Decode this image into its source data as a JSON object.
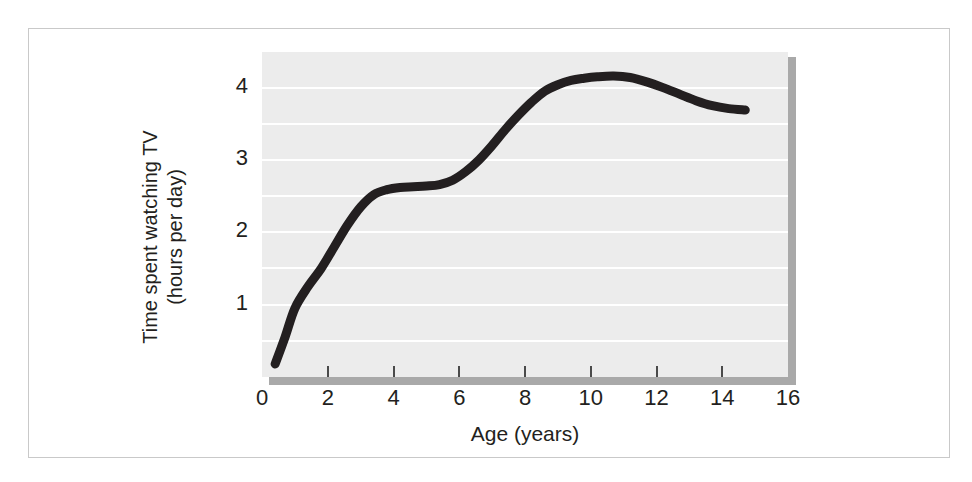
{
  "figure": {
    "background_color": "#ffffff",
    "frame_color": "#c9c9c9",
    "panel_color": "#ececec",
    "gridline_color": "#ffffff",
    "shadow_color": "#a9a9a9",
    "curve_color": "#231f20"
  },
  "chart_data": {
    "type": "line",
    "title": "",
    "subtitle": "",
    "xlabel": "Age (years)",
    "ylabel_line1": "Time spent watching TV",
    "ylabel_line2": "(hours per day)",
    "xlim": [
      0,
      16
    ],
    "ylim": [
      0,
      4.52
    ],
    "xticks": [
      0,
      2,
      4,
      6,
      8,
      10,
      12,
      14,
      16
    ],
    "xtick_labels": [
      "0",
      "2",
      "4",
      "6",
      "8",
      "10",
      "12",
      "14",
      "16"
    ],
    "yticks": [
      1,
      2,
      3,
      4
    ],
    "ytick_labels": [
      "1",
      "2",
      "3",
      "4"
    ],
    "grid": "horizontal",
    "gridline_interval": 0.5,
    "gridline_values": [
      0.5,
      1.0,
      1.5,
      2.0,
      2.5,
      3.0,
      3.5,
      4.0,
      4.5
    ],
    "legend": "none",
    "annotations": [],
    "series": [
      {
        "name": "Time spent watching TV",
        "color": "#231f20",
        "line_width": 9,
        "x": [
          0.4,
          0.7,
          1.0,
          1.4,
          1.8,
          2.2,
          2.6,
          3.0,
          3.4,
          3.8,
          4.2,
          4.6,
          5.0,
          5.4,
          5.8,
          6.2,
          6.6,
          7.0,
          7.4,
          7.8,
          8.2,
          8.6,
          9.0,
          9.4,
          9.8,
          10.2,
          10.7,
          11.2,
          11.7,
          12.2,
          12.7,
          13.2,
          13.7,
          14.2,
          14.7
        ],
        "y": [
          0.18,
          0.55,
          0.95,
          1.25,
          1.5,
          1.8,
          2.1,
          2.35,
          2.52,
          2.59,
          2.62,
          2.63,
          2.64,
          2.66,
          2.72,
          2.84,
          3.0,
          3.2,
          3.42,
          3.62,
          3.8,
          3.95,
          4.04,
          4.1,
          4.13,
          4.15,
          4.16,
          4.14,
          4.08,
          4.0,
          3.91,
          3.82,
          3.75,
          3.71,
          3.69
        ]
      }
    ]
  }
}
